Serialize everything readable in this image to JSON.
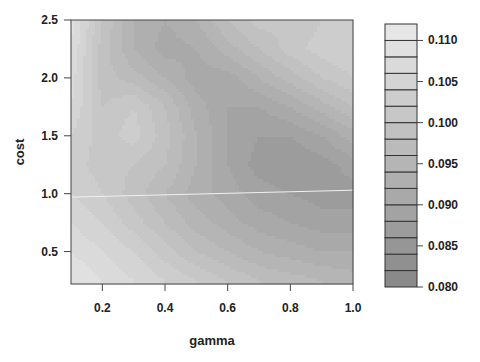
{
  "chart_data": {
    "type": "heatmap",
    "subtype": "filled-contour",
    "title": "",
    "xlabel": "gamma",
    "ylabel": "cost",
    "xlim": [
      0.1,
      1.0
    ],
    "ylim": [
      0.22,
      2.5
    ],
    "x_ticks": [
      0.2,
      0.4,
      0.6,
      0.8,
      1.0
    ],
    "x_tick_labels": [
      "0.2",
      "0.4",
      "0.6",
      "0.8",
      "1.0"
    ],
    "y_ticks": [
      0.5,
      1.0,
      1.5,
      2.0,
      2.5
    ],
    "y_tick_labels": [
      "0.5",
      "1.0",
      "1.5",
      "2.0",
      "2.5"
    ],
    "x": [
      0.1,
      0.2,
      0.3,
      0.4,
      0.5,
      0.6,
      0.7,
      0.8,
      0.9,
      1.0
    ],
    "y": [
      0.25,
      0.5,
      0.75,
      1.0,
      1.25,
      1.5,
      1.75,
      2.0,
      2.25,
      2.5
    ],
    "z": [
      [
        0.11,
        0.108,
        0.106,
        0.104,
        0.102,
        0.1,
        0.098,
        0.097,
        0.096,
        0.095
      ],
      [
        0.108,
        0.106,
        0.104,
        0.101,
        0.098,
        0.096,
        0.094,
        0.093,
        0.092,
        0.092
      ],
      [
        0.106,
        0.104,
        0.101,
        0.098,
        0.095,
        0.093,
        0.091,
        0.09,
        0.089,
        0.089
      ],
      [
        0.104,
        0.102,
        0.099,
        0.096,
        0.093,
        0.091,
        0.089,
        0.088,
        0.087,
        0.087
      ],
      [
        0.103,
        0.101,
        0.1,
        0.098,
        0.094,
        0.09,
        0.087,
        0.086,
        0.087,
        0.089
      ],
      [
        0.104,
        0.101,
        0.103,
        0.099,
        0.094,
        0.09,
        0.088,
        0.088,
        0.09,
        0.093
      ],
      [
        0.106,
        0.1,
        0.102,
        0.098,
        0.093,
        0.09,
        0.09,
        0.092,
        0.095,
        0.098
      ],
      [
        0.107,
        0.099,
        0.097,
        0.094,
        0.091,
        0.091,
        0.094,
        0.097,
        0.1,
        0.102
      ],
      [
        0.108,
        0.099,
        0.094,
        0.091,
        0.092,
        0.095,
        0.098,
        0.101,
        0.103,
        0.104
      ],
      [
        0.109,
        0.1,
        0.094,
        0.092,
        0.094,
        0.098,
        0.101,
        0.1,
        0.102,
        0.104
      ]
    ],
    "levels": [
      0.08,
      0.082,
      0.084,
      0.086,
      0.088,
      0.09,
      0.092,
      0.094,
      0.096,
      0.098,
      0.1,
      0.102,
      0.104,
      0.106,
      0.108,
      0.11,
      0.112
    ],
    "colorbar": {
      "ticks": [
        0.11,
        0.105,
        0.1,
        0.095,
        0.09,
        0.085,
        0.08
      ],
      "tick_labels": [
        "0.110",
        "0.105",
        "0.100",
        "0.095",
        "0.090",
        "0.085",
        "0.080"
      ],
      "min": 0.08,
      "max": 0.112,
      "n_bands": 16
    },
    "colors": {
      "low": "#8a8a8a",
      "high": "#e6e6e6",
      "axis": "#444444",
      "reference_line": "#f0f0f0"
    },
    "annotations": [
      {
        "type": "line",
        "from": [
          0.1,
          0.97
        ],
        "to": [
          1.0,
          1.03
        ],
        "color": "#f0f0f0"
      }
    ],
    "legend_position": "right",
    "grid": false
  }
}
